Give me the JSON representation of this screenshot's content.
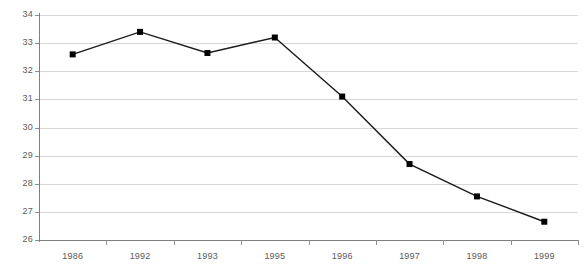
{
  "chart_data": {
    "type": "line",
    "title": "",
    "subtitle": "",
    "xlabel": "",
    "ylabel": "",
    "categories": [
      "1986",
      "1992",
      "1993",
      "1995",
      "1996",
      "1997",
      "1998",
      "1999"
    ],
    "values": [
      32.6,
      33.4,
      32.65,
      33.2,
      31.1,
      28.7,
      27.55,
      26.65
    ],
    "series": [
      {
        "name": "",
        "values": [
          32.6,
          33.4,
          32.65,
          33.2,
          31.1,
          28.7,
          27.55,
          26.65
        ]
      }
    ],
    "ylim": [
      26,
      34
    ],
    "yticks": [
      34,
      33,
      32,
      31,
      30,
      29,
      28,
      27,
      26
    ],
    "ytick_labels": [
      "34",
      "33",
      "32",
      "31",
      "30",
      "29",
      "28",
      "27",
      "26"
    ],
    "grid": true,
    "grid_axis": "y",
    "legend": false,
    "legend_position": "none",
    "annotations": [],
    "colors": {
      "line": "#1a1a1a",
      "marker": "#000000",
      "gridline": "#d8d8d8",
      "axis": "#808080",
      "tick_label": "#5a5a5a",
      "background": "#ffffff"
    },
    "marker": "square",
    "line_width": 1.4,
    "marker_size": 6
  }
}
